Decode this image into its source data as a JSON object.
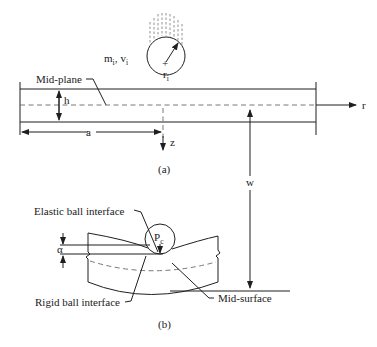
{
  "figure": {
    "panel_a": {
      "caption": "(a)",
      "labels": {
        "mass_velocity_m": "m",
        "mass_velocity_m_sub": "i",
        "mass_velocity_sep": ",",
        "mass_velocity_v": "v",
        "mass_velocity_v_sub": "i",
        "radius": "r",
        "radius_sub": "i",
        "mid_plane": "Mid-plane",
        "thickness": "h",
        "radius_plate": "a",
        "z_axis": "z",
        "r_axis": "r",
        "deflection": "w"
      }
    },
    "panel_b": {
      "caption": "(b)",
      "labels": {
        "elastic_interface": "Elastic ball interface",
        "contact_force": "P",
        "contact_force_sub": "c",
        "indentation": "α",
        "rigid_interface": "Rigid ball interface",
        "mid_surface": "Mid-surface"
      }
    }
  },
  "colors": {
    "line": "#1f1f1f",
    "dashed": "#6a6a6a",
    "background": "#ffffff"
  }
}
